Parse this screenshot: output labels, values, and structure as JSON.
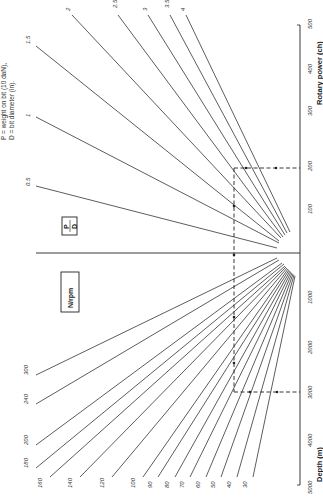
{
  "note": {
    "line1": "P = weight on bit (10 daN),",
    "line2": "D = bit diameter (in)."
  },
  "boxes": {
    "pd_numerator": "P",
    "pd_denominator": "D",
    "rpm": "N/rpm"
  },
  "axis": {
    "power_label": "Rotary power (ch)",
    "depth_label": "Depth (m)",
    "power_ticks": [
      "100",
      "200",
      "300",
      "400",
      "500"
    ],
    "depth_ticks": [
      "1000",
      "2000",
      "3000",
      "4000",
      "5000"
    ]
  },
  "pd_lines": [
    {
      "label": "0.5",
      "x1": 277,
      "y1": 248,
      "x2": 36,
      "y2": 186,
      "lx": 30,
      "ly": 186
    },
    {
      "label": "1",
      "x1": 279,
      "y1": 243,
      "x2": 36,
      "y2": 117,
      "lx": 30,
      "ly": 117
    },
    {
      "label": "1.5",
      "x1": 279,
      "y1": 241,
      "x2": 36,
      "y2": 46,
      "lx": 30,
      "ly": 44
    },
    {
      "label": "2",
      "x1": 281,
      "y1": 238,
      "x2": 72,
      "y2": 15,
      "lx": 70,
      "ly": 11
    },
    {
      "label": "2.5",
      "x1": 283,
      "y1": 237,
      "x2": 118,
      "y2": 15,
      "lx": 117,
      "ly": 8
    },
    {
      "label": "3",
      "x1": 285,
      "y1": 235,
      "x2": 148,
      "y2": 15,
      "lx": 147,
      "ly": 11
    },
    {
      "label": "3.5",
      "x1": 287,
      "y1": 233,
      "x2": 170,
      "y2": 15,
      "lx": 169,
      "ly": 8
    },
    {
      "label": "4",
      "x1": 290,
      "y1": 232,
      "x2": 186,
      "y2": 15,
      "lx": 185,
      "ly": 11
    }
  ],
  "rpm_lines": [
    {
      "label": "300",
      "x1": 277,
      "y1": 258,
      "x2": 36,
      "y2": 375,
      "lx": 28,
      "ly": 375
    },
    {
      "label": "240",
      "x1": 279,
      "y1": 260,
      "x2": 36,
      "y2": 404,
      "lx": 28,
      "ly": 404
    },
    {
      "label": "200",
      "x1": 282,
      "y1": 263,
      "x2": 36,
      "y2": 445,
      "lx": 28,
      "ly": 445
    },
    {
      "label": "180",
      "x1": 284,
      "y1": 264,
      "x2": 36,
      "y2": 468,
      "lx": 28,
      "ly": 468
    },
    {
      "label": "160",
      "x1": 285,
      "y1": 266,
      "x2": 50,
      "y2": 477,
      "lx": 42,
      "ly": 488
    },
    {
      "label": "140",
      "x1": 286,
      "y1": 267,
      "x2": 80,
      "y2": 477,
      "lx": 72,
      "ly": 488
    },
    {
      "label": "120",
      "x1": 287,
      "y1": 268,
      "x2": 112,
      "y2": 477,
      "lx": 104,
      "ly": 488
    },
    {
      "label": "100",
      "x1": 288,
      "y1": 269,
      "x2": 143,
      "y2": 477,
      "lx": 135,
      "ly": 488
    },
    {
      "label": "90",
      "x1": 289,
      "y1": 270,
      "x2": 158,
      "y2": 477,
      "lx": 152,
      "ly": 488
    },
    {
      "label": "80",
      "x1": 290,
      "y1": 271,
      "x2": 175,
      "y2": 477,
      "lx": 169,
      "ly": 488
    },
    {
      "label": "70",
      "x1": 291,
      "y1": 272,
      "x2": 190,
      "y2": 477,
      "lx": 184,
      "ly": 488
    },
    {
      "label": "60",
      "x1": 292,
      "y1": 273,
      "x2": 206,
      "y2": 477,
      "lx": 200,
      "ly": 488
    },
    {
      "label": "50",
      "x1": 293,
      "y1": 274,
      "x2": 221,
      "y2": 477,
      "lx": 215,
      "ly": 488
    },
    {
      "label": "40",
      "x1": 294,
      "y1": 275,
      "x2": 237,
      "y2": 477,
      "lx": 231,
      "ly": 488
    },
    {
      "label": "30",
      "x1": 295,
      "y1": 276,
      "x2": 253,
      "y2": 477,
      "lx": 247,
      "ly": 488
    }
  ],
  "example_path": {
    "power_value": "~190",
    "depth_value": "3000"
  }
}
